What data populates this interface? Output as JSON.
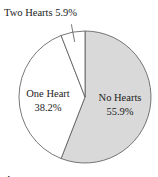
{
  "chart_data": {
    "type": "pie",
    "title": "",
    "categories": [
      "No Hearts",
      "One Heart",
      "Two Hearts"
    ],
    "values": [
      55.9,
      38.2,
      5.9
    ],
    "labels": [
      "No Hearts 55.9%",
      "One Heart 38.2%",
      "Two Hearts 5.9%"
    ],
    "colors": [
      "#d9d9d9",
      "#ffffff",
      "#ffffff"
    ],
    "start_angle": "12 o'clock, clockwise",
    "caption": "Figure 1.1"
  },
  "labels": {
    "no_hearts_name": "No Hearts",
    "no_hearts_pct": "55.9%",
    "one_heart_name": "One Heart",
    "one_heart_pct": "38.2%",
    "two_hearts": "Two Hearts 5.9%",
    "caption": "Figure 1.1"
  }
}
